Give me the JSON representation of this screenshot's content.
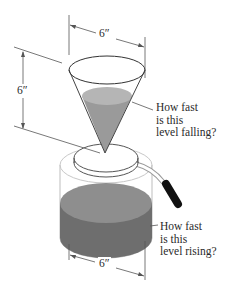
{
  "dimensions": {
    "cone_top_diameter": "6″",
    "cone_height": "6″",
    "jar_diameter": "6″"
  },
  "annotations": {
    "cone_question": "How fast\nis this\nlevel falling?",
    "jar_question": "How fast\nis this\nlevel rising?"
  },
  "colors": {
    "liquid_light": "#b5b5b5",
    "liquid_mid": "#9a9a9a",
    "liquid_dark": "#6e6e6e",
    "handle_grip": "#111111",
    "outline": "#3a3a3a"
  }
}
